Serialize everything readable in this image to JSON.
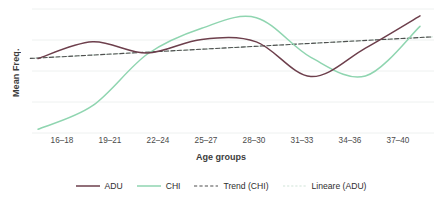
{
  "chart_data": {
    "type": "line",
    "title": "",
    "xlabel": "Age groups",
    "ylabel": "Mean Freq.",
    "categories": [
      "16–18",
      "19–21",
      "22–24",
      "25–27",
      "28–30",
      "31–33",
      "34–36",
      "37–40"
    ],
    "grid": "horizontal",
    "gridlines": 5,
    "ylim": [
      0,
      10
    ],
    "yticklabels": [],
    "legend_position": "bottom",
    "series": [
      {
        "name": "ADU",
        "style": "solid",
        "color": "#6d3f4c",
        "values": [
          6.0,
          7.35,
          6.45,
          7.55,
          7.35,
          4.55,
          6.85,
          9.45
        ]
      },
      {
        "name": "CHI",
        "style": "solid",
        "color": "#8fd5b0",
        "values": [
          0.3,
          2.2,
          6.35,
          8.45,
          9.3,
          6.1,
          4.6,
          8.6
        ]
      },
      {
        "name": "Trend (CHI)",
        "style": "dashed",
        "color": "#4f4f4f",
        "values": [
          6.05,
          6.3,
          6.5,
          6.7,
          6.95,
          7.2,
          7.45,
          7.7
        ]
      },
      {
        "name": "Lineare (ADU)",
        "style": "dotted",
        "color": "#cfe3d8",
        "values": [
          6.05,
          6.3,
          6.5,
          6.7,
          6.95,
          7.2,
          7.45,
          7.7
        ]
      }
    ]
  },
  "axis": {
    "y_label": "Mean Freq.",
    "x_label": "Age groups"
  },
  "legend": {
    "items": [
      {
        "label": "ADU",
        "color": "#6d3f4c",
        "style": "solid"
      },
      {
        "label": "CHI",
        "color": "#8fd5b0",
        "style": "solid"
      },
      {
        "label": "Trend (CHI)",
        "color": "#4f4f4f",
        "style": "dashed"
      },
      {
        "label": "Lineare (ADU)",
        "color": "#cfe3d8",
        "style": "dotted"
      }
    ]
  },
  "colors": {
    "grid": "#eef1f0",
    "adu": "#6d3f4c",
    "chi": "#8fd5b0",
    "trend_chi": "#4f4f4f",
    "lineare_adu": "#cfe3d8",
    "background": "#ffffff",
    "text": "#3c3c3c"
  }
}
